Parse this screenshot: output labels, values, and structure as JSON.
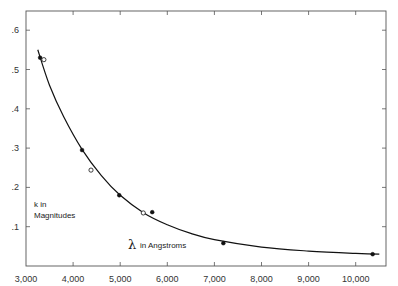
{
  "chart_data": {
    "type": "scatter",
    "title": "",
    "xlabel": "λ in Angstroms",
    "ylabel": "k in Magnitudes",
    "xlim": [
      3000,
      10500
    ],
    "ylim": [
      0,
      0.65
    ],
    "x_ticks": [
      "3,000",
      "4,000",
      "5,000",
      "6,000",
      "7,000",
      "8,000",
      "9,000",
      "10,000"
    ],
    "y_ticks": [
      ".1",
      ".2",
      ".3",
      ".4",
      ".5",
      ".6"
    ],
    "grid": false,
    "legend": null,
    "series": [
      {
        "name": "filled points",
        "marker": "filled-circle",
        "x": [
          3300,
          4190,
          4980,
          5680,
          7190,
          10360
        ],
        "y": [
          0.53,
          0.295,
          0.18,
          0.137,
          0.058,
          0.03
        ]
      },
      {
        "name": "open points",
        "marker": "open-circle",
        "x": [
          3380,
          4380,
          5490
        ],
        "y": [
          0.525,
          0.244,
          0.135
        ]
      },
      {
        "name": "fitted curve",
        "marker": "line",
        "x": [
          3250,
          3500,
          3800,
          4200,
          4600,
          5000,
          5500,
          6000,
          6500,
          7000,
          8000,
          9000,
          10000,
          10500
        ],
        "y": [
          0.55,
          0.46,
          0.38,
          0.295,
          0.23,
          0.18,
          0.135,
          0.105,
          0.083,
          0.067,
          0.048,
          0.038,
          0.032,
          0.03
        ]
      }
    ]
  },
  "labels": {
    "ylabel_line1": "k in",
    "ylabel_line2": "Magnitudes",
    "xlabel_symbol": "λ",
    "xlabel_text": "in Angstroms"
  }
}
